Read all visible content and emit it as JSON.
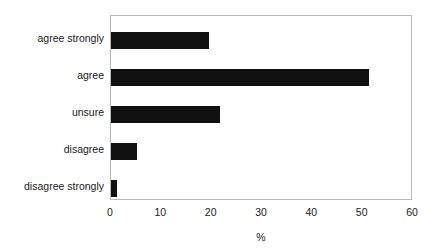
{
  "chart_data": {
    "type": "bar",
    "orientation": "horizontal",
    "title": "",
    "subtitle": "",
    "xlabel": "%",
    "ylabel": "",
    "categories": [
      "agree strongly",
      "agree",
      "unsure",
      "disagree",
      "disagree strongly"
    ],
    "values": [
      19.5,
      51.5,
      21.7,
      5.2,
      1.2
    ],
    "series": [
      {
        "name": "",
        "values": [
          19.5,
          51.5,
          21.7,
          5.2,
          1.2
        ]
      }
    ],
    "xlim": [
      0,
      60
    ],
    "xticks": [
      0,
      10,
      20,
      30,
      40,
      50,
      60
    ],
    "xtick_labels": [
      "0",
      "10",
      "20",
      "30",
      "40",
      "50",
      "60"
    ],
    "grid": false,
    "legend": false,
    "legend_position": "none",
    "bar_color": "#111111",
    "frame_color": "#b8b8b8",
    "background_color": "#ffffff"
  },
  "axis": {
    "x_title": "%"
  }
}
